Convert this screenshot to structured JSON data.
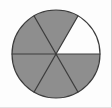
{
  "figure": {
    "type": "pie-fraction-model",
    "total_parts": 6,
    "shaded_parts": 5,
    "unshaded_parts": 1,
    "fraction_text": "5/6",
    "sector_angle_degrees": 60,
    "center": {
      "x": 56,
      "y": 54
    },
    "radius": 44,
    "colors": {
      "shaded_fill": "#8e8e8e",
      "unshaded_fill": "#fdfdfd",
      "outline": "#3c3c3c",
      "divider": "#3c3c3c",
      "background": "#fdfdfd",
      "frame_right": "#cfcfcf",
      "frame_bottom": "#e2e2e2"
    },
    "sectors": [
      {
        "id": "sector-1",
        "label": "right-upper",
        "start_deg": 0,
        "end_deg": 60,
        "shaded": true
      },
      {
        "id": "sector-2",
        "label": "top",
        "start_deg": 60,
        "end_deg": 120,
        "shaded": true
      },
      {
        "id": "sector-3",
        "label": "left-upper",
        "start_deg": 120,
        "end_deg": 180,
        "shaded": false
      },
      {
        "id": "sector-4",
        "label": "left-lower",
        "start_deg": 180,
        "end_deg": 240,
        "shaded": true
      },
      {
        "id": "sector-5",
        "label": "bottom",
        "start_deg": 240,
        "end_deg": 300,
        "shaded": true
      },
      {
        "id": "sector-6",
        "label": "right-lower",
        "start_deg": 300,
        "end_deg": 360,
        "shaded": true
      }
    ],
    "dividers": [
      {
        "id": "divider-horizontal",
        "angle_deg": 0
      },
      {
        "id": "divider-diagonal-a",
        "angle_deg": 60
      },
      {
        "id": "divider-diagonal-b",
        "angle_deg": 120
      }
    ]
  }
}
